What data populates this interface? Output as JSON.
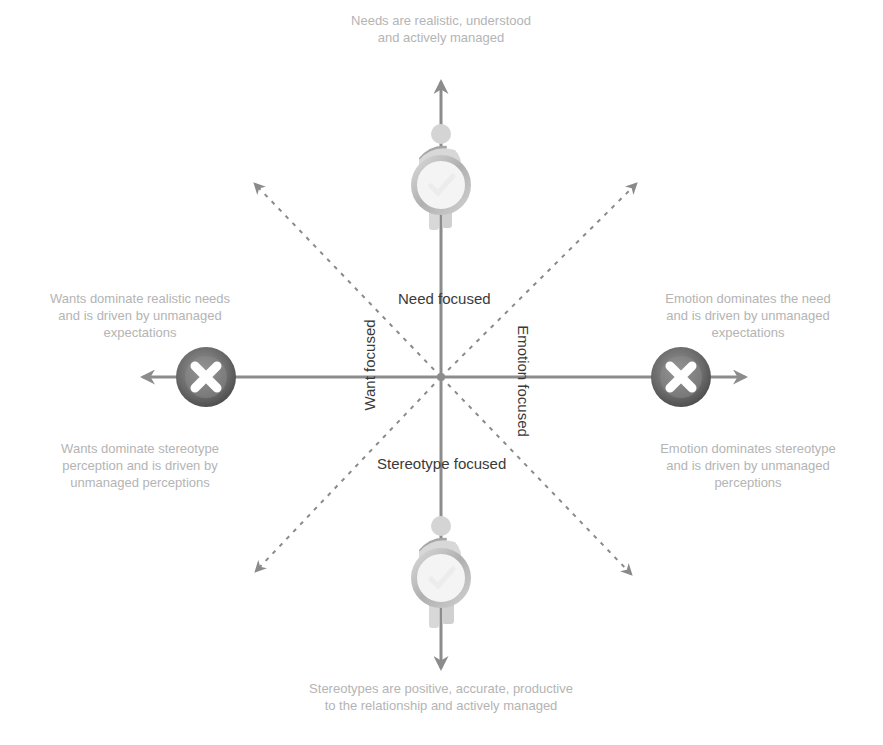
{
  "captions": {
    "top": "Needs are realistic, understood\nand actively managed",
    "left_upper": "Wants dominate realistic needs\nand is driven by unmanaged\nexpectations",
    "right_upper": "Emotion dominates the need\nand is driven by unmanaged\nexpectations",
    "left_lower": "Wants dominate stereotype\nperception and is driven by\nunmanaged perceptions",
    "right_lower": "Emotion dominates stereotype\nand is driven by unmanaged\nperceptions",
    "bottom": "Stereotypes are positive, accurate, productive\nto the relationship and actively managed"
  },
  "axis_labels": {
    "need": "Need focused",
    "want": "Want focused",
    "emotion": "Emotion focused",
    "stereotype": "Stereotype focused"
  },
  "icons": {
    "top": "person-with-checkmark-icon",
    "bottom": "person-with-checkmark-icon",
    "left": "cross-mark-icon",
    "right": "cross-mark-icon"
  },
  "colors": {
    "axis": "#8c8c8c",
    "dashed": "#8a8a8a",
    "caption": "#b4b4b4",
    "label": "#3a3a3a",
    "cross_ring": "#6e6e6e",
    "check_ring": "#c8c8c8",
    "figure": "#d6d6d6",
    "figure_dark": "#a8a8a8"
  }
}
